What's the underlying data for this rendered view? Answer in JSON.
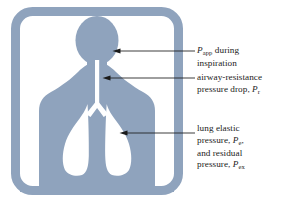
{
  "figure": {
    "colors": {
      "body_fill": "#8fa3bd",
      "frame": "#8fa3bd",
      "background": "#ffffff",
      "lung_fill": "#ffffff",
      "leader_line": "#1a1a1a",
      "text": "#1b1b1b"
    },
    "elements": {
      "frame_label": "rounded-frame",
      "head_label": "head-oval",
      "neck_label": "neck",
      "torso_label": "torso-shoulders",
      "trachea_label": "trachea-airway",
      "lung_left_label": "lung-left",
      "lung_right_label": "lung-right",
      "bronchi_label": "bronchi-split"
    }
  },
  "callouts": [
    {
      "id": "p-app-inspiration",
      "arrow_target": "head",
      "lines": [
        {
          "parts": [
            {
              "type": "var",
              "text": "P"
            },
            {
              "type": "sub",
              "text": "app"
            },
            {
              "type": "plain",
              "text": " during"
            }
          ]
        },
        {
          "parts": [
            {
              "type": "plain",
              "text": "inspiration"
            }
          ]
        }
      ],
      "plain_text": "P_app during inspiration"
    },
    {
      "id": "airway-resistance-pressure-drop",
      "arrow_target": "trachea",
      "lines": [
        {
          "parts": [
            {
              "type": "plain",
              "text": "airway-resistance"
            }
          ]
        },
        {
          "parts": [
            {
              "type": "plain",
              "text": "pressure drop, "
            },
            {
              "type": "var",
              "text": "P"
            },
            {
              "type": "sub",
              "text": "r"
            }
          ]
        }
      ],
      "plain_text": "airway-resistance pressure drop, P_r"
    },
    {
      "id": "lung-elastic-and-residual-pressure",
      "arrow_target": "lung-right",
      "lines": [
        {
          "parts": [
            {
              "type": "plain",
              "text": "lung elastic"
            }
          ]
        },
        {
          "parts": [
            {
              "type": "plain",
              "text": "pressure, "
            },
            {
              "type": "var",
              "text": "P"
            },
            {
              "type": "sub",
              "text": "e"
            },
            {
              "type": "plain",
              "text": ","
            }
          ]
        },
        {
          "parts": [
            {
              "type": "plain",
              "text": "and residual"
            }
          ]
        },
        {
          "parts": [
            {
              "type": "plain",
              "text": "pressure, "
            },
            {
              "type": "var",
              "text": "P"
            },
            {
              "type": "sub",
              "text": "ex"
            }
          ]
        }
      ],
      "plain_text": "lung elastic pressure, P_e, and residual pressure, P_ex"
    }
  ]
}
